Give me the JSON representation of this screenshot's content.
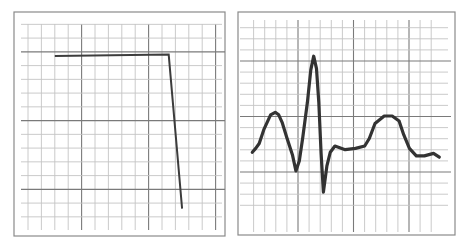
{
  "chart_data": [
    {
      "type": "line",
      "title": "",
      "xlabel": "",
      "ylabel": "",
      "grid": true,
      "grid_minor_cells_x": 15,
      "grid_minor_cells_y": 15,
      "grid_major_every": 5,
      "xlim": [
        0,
        15
      ],
      "ylim": [
        0,
        15
      ],
      "series": [
        {
          "name": "step-response",
          "x": [
            2.0,
            10.5,
            11.5
          ],
          "y": [
            12.7,
            12.8,
            1.6
          ]
        }
      ]
    },
    {
      "type": "line",
      "title": "",
      "xlabel": "",
      "ylabel": "",
      "grid": true,
      "grid_minor_cells_x": 17,
      "grid_minor_cells_y": 17,
      "grid_major_every": 5,
      "xlim": [
        0,
        17
      ],
      "ylim": [
        0,
        17
      ],
      "series": [
        {
          "name": "ecg-waveform",
          "x": [
            0.2,
            0.5,
            0.8,
            1.2,
            1.8,
            2.2,
            2.5,
            2.8,
            3.2,
            3.7,
            4.0,
            4.3,
            4.6,
            5.0,
            5.3,
            5.55,
            5.8,
            6.0,
            6.2,
            6.4,
            6.7,
            7.0,
            7.4,
            8.3,
            9.2,
            10.0,
            10.4,
            10.9,
            11.7,
            12.4,
            13.0,
            13.4,
            13.9,
            14.5,
            15.2,
            16.0,
            16.5
          ],
          "y": [
            6.4,
            6.7,
            7.1,
            8.2,
            9.4,
            9.6,
            9.4,
            8.8,
            7.6,
            6.2,
            4.9,
            5.7,
            7.6,
            10.4,
            13.0,
            14.1,
            13.1,
            10.4,
            6.3,
            3.2,
            5.3,
            6.4,
            6.9,
            6.6,
            6.7,
            6.9,
            7.5,
            8.7,
            9.3,
            9.3,
            8.9,
            7.8,
            6.7,
            6.1,
            6.1,
            6.3,
            6.0
          ]
        }
      ]
    }
  ]
}
